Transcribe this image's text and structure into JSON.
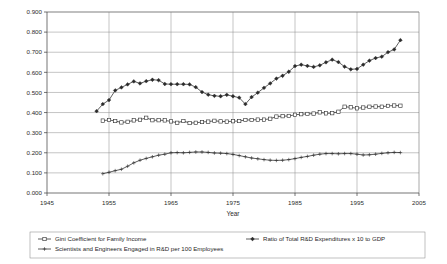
{
  "chart_data": {
    "type": "line",
    "title": "",
    "xlabel": "Year",
    "ylabel": "",
    "xlim": [
      1945,
      2005
    ],
    "ylim": [
      0.0,
      0.9
    ],
    "grid": true,
    "legend_position": "bottom",
    "xticks": [
      "1945",
      "1955",
      "1965",
      "1975",
      "1985",
      "1995",
      "2005"
    ],
    "yticks": [
      "0.000",
      "0.100",
      "0.200",
      "0.300",
      "0.400",
      "0.500",
      "0.600",
      "0.700",
      "0.800",
      "0.900"
    ],
    "series": [
      {
        "name": "Gini Coefficient for Family Income",
        "marker": "open-square",
        "x": [
          1954,
          1955,
          1956,
          1957,
          1958,
          1959,
          1960,
          1961,
          1962,
          1963,
          1964,
          1965,
          1966,
          1967,
          1968,
          1969,
          1970,
          1971,
          1972,
          1973,
          1974,
          1975,
          1976,
          1977,
          1978,
          1979,
          1980,
          1981,
          1982,
          1983,
          1984,
          1985,
          1986,
          1987,
          1988,
          1989,
          1990,
          1991,
          1992,
          1993,
          1994,
          1995,
          1996,
          1997,
          1998,
          1999,
          2000,
          2001,
          2002
        ],
        "values": [
          0.36,
          0.363,
          0.358,
          0.351,
          0.354,
          0.361,
          0.364,
          0.374,
          0.362,
          0.362,
          0.361,
          0.356,
          0.349,
          0.358,
          0.348,
          0.349,
          0.353,
          0.355,
          0.359,
          0.356,
          0.355,
          0.357,
          0.358,
          0.363,
          0.363,
          0.365,
          0.365,
          0.369,
          0.38,
          0.382,
          0.383,
          0.389,
          0.392,
          0.393,
          0.395,
          0.401,
          0.396,
          0.397,
          0.404,
          0.429,
          0.426,
          0.421,
          0.425,
          0.429,
          0.43,
          0.429,
          0.433,
          0.435,
          0.434
        ]
      },
      {
        "name": "Ratio of Total R&D Expenditures x 10 to GDP",
        "marker": "filled-diamond",
        "x": [
          1953,
          1954,
          1955,
          1956,
          1957,
          1958,
          1959,
          1960,
          1961,
          1962,
          1963,
          1964,
          1965,
          1966,
          1967,
          1968,
          1969,
          1970,
          1971,
          1972,
          1973,
          1974,
          1975,
          1976,
          1977,
          1978,
          1979,
          1980,
          1981,
          1982,
          1983,
          1984,
          1985,
          1986,
          1987,
          1988,
          1989,
          1990,
          1991,
          1992,
          1993,
          1994,
          1995,
          1996,
          1997,
          1998,
          1999,
          2000,
          2001,
          2002
        ],
        "values": [
          0.407,
          0.442,
          0.462,
          0.51,
          0.525,
          0.54,
          0.555,
          0.545,
          0.556,
          0.563,
          0.561,
          0.542,
          0.541,
          0.541,
          0.541,
          0.54,
          0.526,
          0.502,
          0.489,
          0.483,
          0.481,
          0.488,
          0.481,
          0.474,
          0.442,
          0.477,
          0.499,
          0.523,
          0.545,
          0.569,
          0.583,
          0.603,
          0.631,
          0.638,
          0.632,
          0.627,
          0.635,
          0.65,
          0.663,
          0.651,
          0.628,
          0.615,
          0.617,
          0.638,
          0.658,
          0.671,
          0.678,
          0.7,
          0.714,
          0.76
        ]
      },
      {
        "name": "Scientists and Engineers Engaged in R&D per 100 Employees",
        "marker": "plus",
        "x": [
          1954,
          1955,
          1956,
          1957,
          1958,
          1959,
          1960,
          1961,
          1962,
          1963,
          1964,
          1965,
          1966,
          1967,
          1968,
          1969,
          1970,
          1971,
          1972,
          1973,
          1974,
          1975,
          1976,
          1977,
          1978,
          1979,
          1980,
          1981,
          1982,
          1983,
          1984,
          1985,
          1986,
          1987,
          1988,
          1989,
          1990,
          1991,
          1992,
          1993,
          1994,
          1995,
          1996,
          1997,
          1998,
          1999,
          2000,
          2001,
          2002
        ],
        "values": [
          0.096,
          0.103,
          0.111,
          0.118,
          0.133,
          0.15,
          0.163,
          0.172,
          0.18,
          0.188,
          0.193,
          0.2,
          0.201,
          0.2,
          0.202,
          0.204,
          0.204,
          0.202,
          0.199,
          0.198,
          0.196,
          0.192,
          0.186,
          0.18,
          0.174,
          0.17,
          0.166,
          0.163,
          0.162,
          0.163,
          0.166,
          0.171,
          0.177,
          0.182,
          0.188,
          0.193,
          0.196,
          0.196,
          0.195,
          0.196,
          0.196,
          0.193,
          0.189,
          0.19,
          0.193,
          0.197,
          0.2,
          0.202,
          0.201
        ]
      }
    ]
  },
  "legend": {
    "entries": [
      {
        "label": "Gini Coefficient for Family Income",
        "marker": "open-square"
      },
      {
        "label": "Ratio of Total R&D Expenditures x 10 to GDP",
        "marker": "filled-diamond"
      },
      {
        "label": "Scientists and Engineers Engaged in R&D per 100 Employees",
        "marker": "plus"
      }
    ]
  },
  "axes": {
    "x_title": "Year"
  }
}
